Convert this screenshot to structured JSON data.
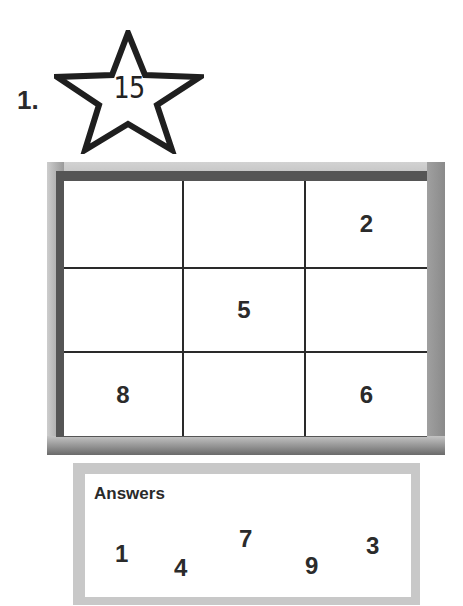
{
  "problem": {
    "number_label": "1.",
    "target_sum": "15",
    "star_icon": "star-outline-icon"
  },
  "grid": {
    "rows": 3,
    "cols": 3,
    "cells": [
      [
        "",
        "",
        "2"
      ],
      [
        "",
        "5",
        ""
      ],
      [
        "8",
        "",
        "6"
      ]
    ]
  },
  "answers": {
    "title": "Answers",
    "values": [
      "1",
      "4",
      "7",
      "9",
      "3"
    ]
  }
}
